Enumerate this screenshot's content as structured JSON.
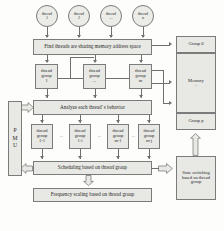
{
  "diagram": {
    "colors": {
      "box_fill": "#e8e8e4",
      "box_stroke": "#7b7b7b",
      "line": "#6f6f6f",
      "text": "#2b2b2b",
      "page": "#fdfdfc"
    },
    "threads": [
      {
        "line1": "thread",
        "line2": "1"
      },
      {
        "line1": "thread",
        "line2": "2"
      },
      {
        "line1": "thread",
        "line2": "..."
      },
      {
        "line1": "thread",
        "line2": "n"
      }
    ],
    "find_threads": "Find threads are sharing memory address space",
    "thread_groups_top": [
      {
        "line1": "thread",
        "line2": "group",
        "line3": "1"
      },
      {
        "line1": "thread",
        "line2": "group",
        "line3": "..."
      },
      {
        "line1": "thread",
        "line2": "group",
        "line3": "m"
      }
    ],
    "analyze": "Analyze each thread' s behavior",
    "thread_groups_bottom": [
      {
        "line1": "thread",
        "line2": "group",
        "line3": "1-1"
      },
      {
        "line1": "thread",
        "line2": "group",
        "line3": "1-i"
      },
      {
        "line1": "thread",
        "line2": "group",
        "line3": "m-1"
      },
      {
        "line1": "thread",
        "line2": "group",
        "line3": "m-j"
      }
    ],
    "ellipsis": "...",
    "scheduling": "Scheduling based on thread group",
    "frequency_scaling": "Frequency scaling based on thread group",
    "pmu": {
      "l1": "P",
      "l2": "M",
      "l3": "U"
    },
    "memory_panel": {
      "group_first": "Group 0",
      "memory_label": "Memory",
      "memory_ellipsis": "...",
      "group_last": "Group p"
    },
    "state_switching": "State switching based on thread group"
  }
}
